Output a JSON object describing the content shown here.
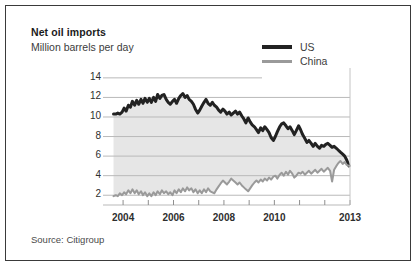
{
  "figure": {
    "title": "Net oil imports",
    "subtitle": "Million barrels per day",
    "source": "Source: Citigroup"
  },
  "colors": {
    "us_line": "#222222",
    "china_line": "#9a9a9a",
    "gridline": "#b9b9b9",
    "shaded_band": "#e6e6e6",
    "frame_border": "#3a3a3a",
    "background": "#ffffff",
    "text": "#2e2e2e"
  },
  "legend": {
    "position": "top-right",
    "items": [
      {
        "label": "US",
        "color": "#222222",
        "width": 4
      },
      {
        "label": "China",
        "color": "#9a9a9a",
        "width": 3
      }
    ]
  },
  "chart_data": {
    "type": "line",
    "title": "Net oil imports",
    "subtitle": "Million barrels per day",
    "xlabel": "",
    "ylabel": "Million barrels per day",
    "source": "Source: Citigroup",
    "grid": true,
    "grid_axis": "y",
    "legend_position": "top-right",
    "xlim": [
      2003.6,
      2013.0
    ],
    "ylim": [
      1.0,
      14.6
    ],
    "yticks": [
      2,
      4,
      6,
      8,
      10,
      12,
      14
    ],
    "ytick_labels": [
      "2",
      "4",
      "6",
      "8",
      "10",
      "12",
      "14"
    ],
    "xticks": [
      2004,
      2005,
      2006,
      2007,
      2008,
      2009,
      2010,
      2011,
      2012,
      2013
    ],
    "xtick_labels_shown": [
      "2004",
      "2006",
      "2008",
      "2010",
      "2013"
    ],
    "xtick_label_positions": [
      2004,
      2006,
      2008,
      2010,
      2013
    ],
    "series": [
      {
        "name": "US",
        "color": "#222222",
        "linewidth": 3,
        "x": [
          2003.62,
          2003.71,
          2003.79,
          2003.87,
          2003.96,
          2004.04,
          2004.12,
          2004.21,
          2004.29,
          2004.37,
          2004.46,
          2004.54,
          2004.62,
          2004.71,
          2004.79,
          2004.87,
          2004.96,
          2005.04,
          2005.12,
          2005.21,
          2005.29,
          2005.37,
          2005.46,
          2005.54,
          2005.62,
          2005.71,
          2005.79,
          2005.87,
          2005.96,
          2006.04,
          2006.12,
          2006.21,
          2006.29,
          2006.37,
          2006.46,
          2006.54,
          2006.62,
          2006.71,
          2006.79,
          2006.87,
          2006.96,
          2007.04,
          2007.12,
          2007.21,
          2007.29,
          2007.37,
          2007.46,
          2007.54,
          2007.62,
          2007.71,
          2007.79,
          2007.87,
          2007.96,
          2008.04,
          2008.12,
          2008.21,
          2008.29,
          2008.37,
          2008.46,
          2008.54,
          2008.62,
          2008.71,
          2008.79,
          2008.87,
          2008.96,
          2009.04,
          2009.12,
          2009.21,
          2009.29,
          2009.37,
          2009.46,
          2009.54,
          2009.62,
          2009.71,
          2009.79,
          2009.87,
          2009.96,
          2010.04,
          2010.12,
          2010.21,
          2010.29,
          2010.37,
          2010.46,
          2010.54,
          2010.62,
          2010.71,
          2010.79,
          2010.87,
          2010.96,
          2011.04,
          2011.12,
          2011.21,
          2011.29,
          2011.37,
          2011.46,
          2011.54,
          2011.62,
          2011.71,
          2011.79,
          2011.87,
          2011.96,
          2012.04,
          2012.12,
          2012.21,
          2012.29,
          2012.37,
          2012.46,
          2012.54,
          2012.62,
          2012.71,
          2012.79,
          2012.87,
          2012.96
        ],
        "values": [
          10.3,
          10.3,
          10.4,
          10.3,
          10.5,
          10.9,
          10.6,
          11.2,
          11.0,
          11.6,
          11.2,
          11.7,
          11.3,
          11.8,
          11.4,
          11.9,
          11.5,
          11.9,
          11.5,
          12.0,
          11.6,
          12.3,
          11.9,
          12.2,
          12.3,
          11.8,
          11.5,
          11.3,
          11.6,
          11.8,
          11.4,
          11.9,
          12.2,
          12.4,
          12.0,
          12.2,
          11.8,
          11.6,
          11.3,
          10.8,
          10.4,
          10.7,
          11.1,
          11.5,
          11.8,
          11.4,
          11.2,
          11.5,
          11.2,
          11.0,
          10.7,
          10.5,
          10.8,
          10.6,
          10.3,
          10.5,
          10.2,
          10.4,
          10.6,
          10.3,
          10.5,
          10.1,
          9.8,
          9.4,
          9.9,
          9.5,
          9.2,
          9.0,
          8.7,
          8.4,
          8.9,
          8.6,
          9.0,
          8.7,
          8.4,
          7.9,
          7.6,
          8.0,
          8.5,
          9.0,
          9.3,
          9.4,
          9.1,
          8.8,
          9.0,
          8.6,
          8.2,
          8.6,
          9.1,
          8.7,
          8.2,
          7.8,
          7.4,
          7.6,
          7.3,
          7.0,
          7.3,
          7.0,
          6.8,
          7.1,
          7.0,
          7.2,
          7.3,
          7.1,
          6.9,
          7.0,
          6.8,
          6.6,
          6.4,
          6.2,
          6.0,
          5.6,
          5.0
        ]
      },
      {
        "name": "China",
        "color": "#9a9a9a",
        "linewidth": 2,
        "x": [
          2003.62,
          2003.71,
          2003.79,
          2003.87,
          2003.96,
          2004.04,
          2004.12,
          2004.21,
          2004.29,
          2004.37,
          2004.46,
          2004.54,
          2004.62,
          2004.71,
          2004.79,
          2004.87,
          2004.96,
          2005.04,
          2005.12,
          2005.21,
          2005.29,
          2005.37,
          2005.46,
          2005.54,
          2005.62,
          2005.71,
          2005.79,
          2005.87,
          2005.96,
          2006.04,
          2006.12,
          2006.21,
          2006.29,
          2006.37,
          2006.46,
          2006.54,
          2006.62,
          2006.71,
          2006.79,
          2006.87,
          2006.96,
          2007.04,
          2007.12,
          2007.21,
          2007.29,
          2007.37,
          2007.46,
          2007.54,
          2007.62,
          2007.71,
          2007.79,
          2007.87,
          2007.96,
          2008.04,
          2008.12,
          2008.21,
          2008.29,
          2008.37,
          2008.46,
          2008.54,
          2008.62,
          2008.71,
          2008.79,
          2008.87,
          2008.96,
          2009.04,
          2009.12,
          2009.21,
          2009.29,
          2009.37,
          2009.46,
          2009.54,
          2009.62,
          2009.71,
          2009.79,
          2009.87,
          2009.96,
          2010.04,
          2010.12,
          2010.21,
          2010.29,
          2010.37,
          2010.46,
          2010.54,
          2010.62,
          2010.71,
          2010.79,
          2010.87,
          2010.96,
          2011.04,
          2011.12,
          2011.21,
          2011.29,
          2011.37,
          2011.46,
          2011.54,
          2011.62,
          2011.71,
          2011.79,
          2011.87,
          2011.96,
          2012.04,
          2012.12,
          2012.21,
          2012.29,
          2012.37,
          2012.46,
          2012.54,
          2012.62,
          2012.71,
          2012.79,
          2012.87,
          2012.96
        ],
        "values": [
          1.9,
          2.0,
          1.9,
          2.2,
          2.0,
          2.3,
          2.1,
          2.5,
          2.2,
          2.6,
          2.2,
          2.5,
          2.1,
          2.4,
          2.0,
          2.3,
          1.9,
          2.2,
          1.9,
          2.3,
          2.0,
          2.4,
          2.1,
          2.5,
          2.2,
          2.4,
          2.1,
          2.3,
          2.0,
          2.5,
          2.2,
          2.6,
          2.3,
          2.7,
          2.4,
          2.8,
          2.5,
          2.7,
          2.3,
          2.6,
          2.2,
          2.5,
          2.2,
          2.6,
          2.3,
          2.7,
          2.4,
          2.3,
          2.2,
          2.6,
          2.9,
          3.2,
          3.5,
          3.3,
          3.1,
          3.4,
          3.7,
          3.5,
          3.3,
          3.1,
          3.3,
          3.0,
          2.8,
          2.6,
          2.4,
          2.7,
          3.0,
          3.3,
          3.5,
          3.3,
          3.6,
          3.4,
          3.7,
          3.5,
          3.8,
          3.6,
          3.9,
          4.0,
          3.7,
          4.1,
          4.3,
          4.0,
          4.4,
          4.1,
          4.5,
          4.2,
          3.8,
          4.0,
          4.3,
          4.2,
          4.4,
          4.1,
          4.3,
          4.5,
          4.2,
          4.4,
          4.6,
          4.3,
          4.5,
          4.7,
          4.4,
          4.6,
          4.8,
          4.5,
          3.4,
          4.6,
          5.0,
          5.3,
          5.5,
          5.2,
          5.4,
          5.1,
          5.0
        ]
      }
    ],
    "shaded_band": {
      "note": "light gray fill between the US line and the China line",
      "color": "#e6e6e6"
    }
  }
}
